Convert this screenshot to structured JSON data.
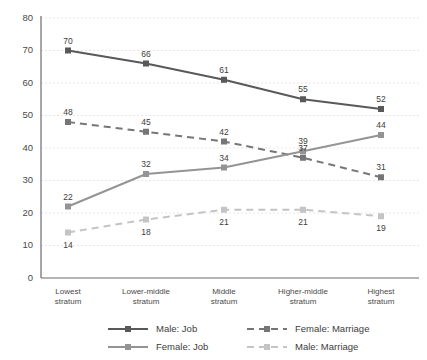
{
  "chart_data": {
    "type": "line",
    "title": "",
    "xlabel": "",
    "ylabel": "",
    "ylim": [
      0,
      80
    ],
    "ytick_values": [
      0,
      10,
      20,
      30,
      40,
      50,
      60,
      70,
      80
    ],
    "ytick_labels": [
      "0",
      "10",
      "20",
      "30",
      "40",
      "50",
      "60",
      "70",
      "80"
    ],
    "grid": true,
    "legend_position": "bottom",
    "categories": [
      "Lowest stratum",
      "Lower-middle stratum",
      "Middle stratum",
      "Higher-middle stratum",
      "Highest stratum"
    ],
    "category_lines": [
      [
        "Lowest",
        "stratum"
      ],
      [
        "Lower-middle",
        "stratum"
      ],
      [
        "Middle",
        "stratum"
      ],
      [
        "Higher-middle",
        "stratum"
      ],
      [
        "Highest",
        "stratum"
      ]
    ],
    "series": [
      {
        "name": "Male: Job",
        "values": [
          70,
          66,
          61,
          55,
          52
        ],
        "color": "#595959",
        "style": "solid",
        "label_position": "above"
      },
      {
        "name": "Female: Marriage",
        "values": [
          48,
          45,
          42,
          37,
          31
        ],
        "color": "#767676",
        "style": "dashed",
        "label_position": "above"
      },
      {
        "name": "Female: Job",
        "values": [
          22,
          32,
          34,
          39,
          44
        ],
        "color": "#949494",
        "style": "solid",
        "label_position": "above"
      },
      {
        "name": "Male: Marriage",
        "values": [
          14,
          18,
          21,
          21,
          19
        ],
        "color": "#c4c4c4",
        "style": "dashed",
        "label_position": "below"
      }
    ],
    "legend_entries": [
      {
        "label": "Male: Job",
        "color": "#595959",
        "style": "solid"
      },
      {
        "label": "Female: Marriage",
        "color": "#767676",
        "style": "dashed"
      },
      {
        "label": "Female: Job",
        "color": "#949494",
        "style": "solid"
      },
      {
        "label": "Male: Marriage",
        "color": "#c4c4c4",
        "style": "dashed"
      }
    ]
  },
  "colors": {
    "background": "#ffffff",
    "axis": "#6b6b6b",
    "grid": "#e6dede",
    "text": "#3f3f3f"
  }
}
